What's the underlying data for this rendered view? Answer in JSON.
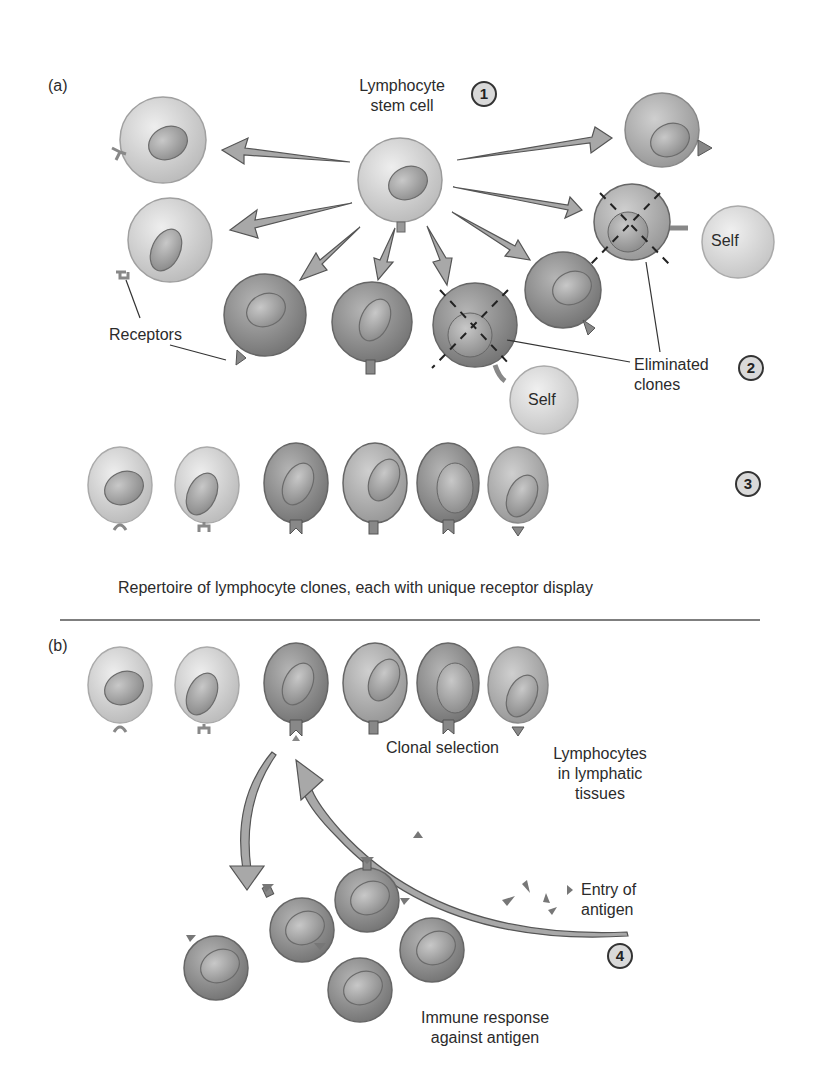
{
  "figure": {
    "panel_a": {
      "label": "(a)",
      "stem_cell_label_line1": "Lymphocyte",
      "stem_cell_label_line2": "stem cell",
      "step1": "1",
      "receptors_label": "Receptors",
      "self_label_1": "Self",
      "self_label_2": "Self",
      "eliminated_line1": "Eliminated",
      "eliminated_line2": "clones",
      "step2": "2",
      "step3": "3",
      "repertoire_caption": "Repertoire of lymphocyte clones, each with unique receptor display"
    },
    "panel_b": {
      "label": "(b)",
      "clonal_selection": "Clonal selection",
      "lymphocytes_line1": "Lymphocytes",
      "lymphocytes_line2": "in lymphatic",
      "lymphocytes_line3": "tissues",
      "entry_line1": "Entry of",
      "entry_line2": "antigen",
      "step4": "4",
      "immune_line1": "Immune response",
      "immune_line2": "against antigen"
    },
    "colors": {
      "light_cell": "#d6d6d6",
      "dark_cell": "#8f8f8f",
      "arrow_fill": "#a8a8a8",
      "outline": "#555555"
    }
  }
}
